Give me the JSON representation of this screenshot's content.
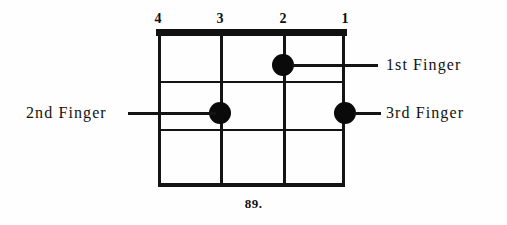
{
  "figure": {
    "caption": "89.",
    "type": "chord-diagram",
    "instrument_strings": 4,
    "frets_shown": 3,
    "ink_color": "#111111",
    "background_color": "#fefefe"
  },
  "string_numbers": [
    {
      "label": "4",
      "x": 158
    },
    {
      "label": "3",
      "x": 220
    },
    {
      "label": "2",
      "x": 283
    },
    {
      "label": "1",
      "x": 345
    }
  ],
  "fingerings": [
    {
      "id": "first-finger",
      "label": "1st Finger",
      "string": "2",
      "fret": 1,
      "dot_x": 125,
      "dot_y": 32,
      "leader_side": "right",
      "leader_x": 134,
      "leader_y": 31,
      "leader_width": 86,
      "label_x": 386,
      "label_y": 57
    },
    {
      "id": "second-finger",
      "label": "2nd Finger",
      "string": "3",
      "fret": 2,
      "dot_x": 62,
      "dot_y": 80,
      "leader_side": "left",
      "leader_x": -30,
      "leader_y": 79,
      "leader_width": 88,
      "label_x": 26,
      "label_y": 105
    },
    {
      "id": "third-finger",
      "label": "3rd Finger",
      "string": "1",
      "fret": 2,
      "dot_x": 187,
      "dot_y": 80,
      "leader_side": "right",
      "leader_x": 196,
      "leader_y": 79,
      "leader_width": 27,
      "label_x": 386,
      "label_y": 105
    }
  ],
  "grid": {
    "strings_x": [
      0,
      62,
      125,
      187
    ],
    "frets_y": [
      48,
      96,
      150
    ]
  }
}
